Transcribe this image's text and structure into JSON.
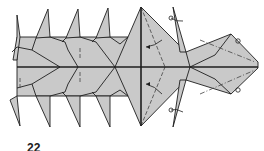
{
  "diagram": {
    "type": "origami folding diagram",
    "step_number": "22",
    "colors": {
      "paper": "#c9c9c9",
      "line": "#1e1e1e",
      "valley": "#444444",
      "background": "#ffffff"
    },
    "annotations": [
      {
        "kind": "valley-fold-arrow",
        "location": "upper-center flap"
      },
      {
        "kind": "valley-fold-arrow",
        "location": "lower-center flap"
      },
      {
        "kind": "flip-arrow",
        "location": "upper-right spike"
      },
      {
        "kind": "flip-arrow",
        "location": "lower-right spike"
      },
      {
        "kind": "mountain-fold-marker",
        "location": "upper-right corner"
      },
      {
        "kind": "mountain-fold-marker",
        "location": "lower-right corner"
      }
    ]
  }
}
